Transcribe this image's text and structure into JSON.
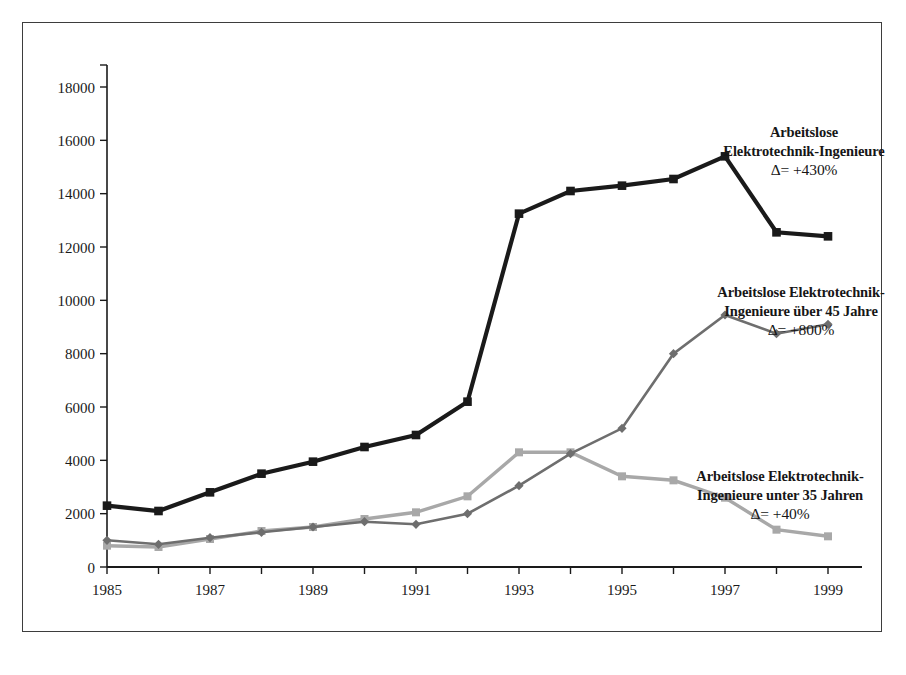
{
  "chart_data": {
    "type": "line",
    "title": "",
    "xlabel": "",
    "ylabel": "",
    "x": [
      1985,
      1986,
      1987,
      1988,
      1989,
      1990,
      1991,
      1992,
      1993,
      1994,
      1995,
      1996,
      1997,
      1998,
      1999
    ],
    "xtick_labels": [
      "1985",
      "1987",
      "1989",
      "1991",
      "1993",
      "1995",
      "1997",
      "1999"
    ],
    "xtick_values": [
      1985,
      1987,
      1989,
      1991,
      1993,
      1995,
      1997,
      1999
    ],
    "xlim": [
      1985,
      1999
    ],
    "ylim": [
      0,
      18000
    ],
    "ytick_labels": [
      "0",
      "2000",
      "4000",
      "6000",
      "8000",
      "10000",
      "12000",
      "14000",
      "16000",
      "18000"
    ],
    "ytick_values": [
      0,
      2000,
      4000,
      6000,
      8000,
      10000,
      12000,
      14000,
      16000,
      18000
    ],
    "grid": false,
    "legend_position": "inline-annotations",
    "series": [
      {
        "name": "Arbeitslose Elektrotechnik-Ingenieure",
        "color": "#1a1a1a",
        "marker": "square",
        "values": [
          2300,
          2100,
          2800,
          3500,
          3950,
          4500,
          4950,
          6200,
          13250,
          14100,
          14300,
          14550,
          15400,
          12550,
          12400
        ]
      },
      {
        "name": "Arbeitslose Elektrotechnik-Ingenieure über 45 Jahre",
        "color": "#6e6e6e",
        "marker": "diamond",
        "values": [
          1000,
          850,
          1100,
          1300,
          1500,
          1700,
          1600,
          2000,
          3050,
          4250,
          5200,
          8000,
          9450,
          8750,
          9100
        ]
      },
      {
        "name": "Arbeitslose Elektrotechnik-Ingenieure unter 35 Jahren",
        "color": "#a8a8a8",
        "marker": "square",
        "values": [
          800,
          750,
          1050,
          1350,
          1500,
          1800,
          2050,
          2650,
          4300,
          4300,
          3400,
          3250,
          2600,
          1400,
          1150
        ]
      }
    ],
    "annotations": [
      {
        "id": "total",
        "line1": "Arbeitslose",
        "line2": "Elektrotechnik-Ingenieure",
        "delta": "Δ= +430%"
      },
      {
        "id": "over45",
        "line1": "Arbeitslose Elektrotechnik-",
        "line2": "Ingenieure über 45 Jahre",
        "delta": "Δ= +800%"
      },
      {
        "id": "under35",
        "line1": "Arbeitslose Elektrotechnik-",
        "line2": "Ingenieure unter 35 Jahren",
        "delta": "Δ= +40%"
      }
    ]
  },
  "colors": {
    "frame": "#3d3d3d",
    "axis": "#1a1a1a",
    "background": "#ffffff",
    "series_total": "#1a1a1a",
    "series_over45": "#6e6e6e",
    "series_under35": "#a8a8a8"
  }
}
